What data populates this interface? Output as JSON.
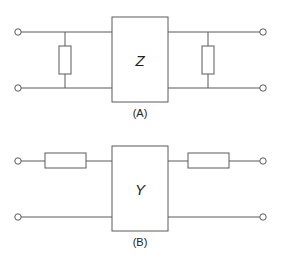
{
  "diagram": {
    "type": "two-port network equivalent circuits",
    "circuits": [
      {
        "id": "A",
        "caption": "(A)",
        "block_label": "Z",
        "topology": "pi: shunt resistor at input, Z block, shunt resistor at output",
        "components": [
          {
            "kind": "terminal",
            "position": "input-top"
          },
          {
            "kind": "terminal",
            "position": "input-bottom"
          },
          {
            "kind": "resistor",
            "orientation": "vertical",
            "connection": "shunt",
            "side": "input"
          },
          {
            "kind": "block",
            "label": "Z"
          },
          {
            "kind": "resistor",
            "orientation": "vertical",
            "connection": "shunt",
            "side": "output"
          },
          {
            "kind": "terminal",
            "position": "output-top"
          },
          {
            "kind": "terminal",
            "position": "output-bottom"
          }
        ]
      },
      {
        "id": "B",
        "caption": "(B)",
        "block_label": "Y",
        "topology": "tee: series resistor at input, Y block, series resistor at output",
        "components": [
          {
            "kind": "terminal",
            "position": "input-top"
          },
          {
            "kind": "terminal",
            "position": "input-bottom"
          },
          {
            "kind": "resistor",
            "orientation": "horizontal",
            "connection": "series",
            "side": "input"
          },
          {
            "kind": "block",
            "label": "Y"
          },
          {
            "kind": "resistor",
            "orientation": "horizontal",
            "connection": "series",
            "side": "output"
          },
          {
            "kind": "terminal",
            "position": "output-top"
          },
          {
            "kind": "terminal",
            "position": "output-bottom"
          }
        ]
      }
    ],
    "colors": {
      "line": "#5a5a5a",
      "text": "#222222",
      "background": "#ffffff"
    }
  }
}
